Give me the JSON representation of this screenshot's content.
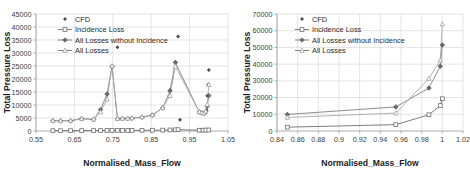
{
  "figure": {
    "panel_count": 2
  },
  "chart_data": [
    {
      "panel_id": "left",
      "type": "scatter",
      "title": "",
      "xlabel": "Normalised_Mass_Flow",
      "ylabel": "Total Pressure Loss",
      "xlim": [
        0.55,
        1.05
      ],
      "ylim": [
        0,
        45000
      ],
      "xticks": [
        0.55,
        0.65,
        0.75,
        0.85,
        0.95,
        1.05
      ],
      "xtick_labels": [
        "0.55",
        "0.65",
        "0.75",
        "0.85",
        "0.95",
        "1.05"
      ],
      "yticks": [
        0,
        5000,
        10000,
        15000,
        20000,
        25000,
        30000,
        35000,
        40000,
        45000
      ],
      "ytick_labels": [
        "0",
        "5000",
        "10000",
        "15000",
        "20000",
        "25000",
        "30000",
        "35000",
        "40000",
        "45000"
      ],
      "grid": "y-major-and-x-major",
      "legend_position": "top-left-inside",
      "legend": [
        "CFD",
        "Incidence Loss",
        "All Losses without Incidence",
        "All Losses"
      ],
      "series": [
        {
          "name": "CFD",
          "marker": "small-diamond",
          "line": false,
          "x": [
            0.594,
            0.614,
            0.64,
            0.669,
            0.7,
            0.718,
            0.735,
            0.748,
            0.762,
            0.775,
            0.789,
            0.8,
            0.826,
            0.853,
            0.88,
            0.899,
            0.913,
            0.92,
            0.925,
            0.975,
            0.98,
            0.985,
            0.988,
            0.99,
            0.992,
            0.994,
            0.996,
            0.998,
            1.0
          ],
          "y": [
            3900,
            3900,
            3900,
            4700,
            4400,
            8200,
            14200,
            24900,
            32200,
            4700,
            4800,
            4900,
            5300,
            6100,
            8900,
            15500,
            26400,
            36300,
            4300,
            7300,
            7100,
            6900,
            6800,
            7000,
            7400,
            8100,
            13600,
            17800,
            23500
          ]
        },
        {
          "name": "Incidence Loss",
          "marker": "open-square",
          "line": true,
          "x": [
            0.594,
            0.614,
            0.64,
            0.669,
            0.7,
            0.718,
            0.735,
            0.748,
            0.762,
            0.775,
            0.789,
            0.8,
            0.826,
            0.853,
            0.88,
            0.899,
            0.913,
            0.92,
            0.975,
            0.985,
            0.992,
            1.0
          ],
          "y": [
            120,
            120,
            130,
            150,
            160,
            180,
            200,
            230,
            260,
            200,
            210,
            230,
            260,
            300,
            340,
            400,
            460,
            520,
            300,
            320,
            350,
            400
          ]
        },
        {
          "name": "All Losses without Incidence",
          "marker": "filled-diamond",
          "line": true,
          "x": [
            0.594,
            0.614,
            0.64,
            0.669,
            0.7,
            0.718,
            0.735,
            0.748,
            0.762,
            0.775,
            0.789,
            0.8,
            0.826,
            0.853,
            0.88,
            0.899,
            0.913,
            0.975,
            0.982,
            0.988,
            0.992,
            0.996,
            1.0
          ],
          "y": [
            3900,
            3900,
            3900,
            4700,
            4400,
            8200,
            14200,
            24900,
            4700,
            4750,
            4800,
            4900,
            5300,
            6100,
            8900,
            15500,
            26400,
            7300,
            6900,
            6800,
            7400,
            9500,
            13600
          ]
        },
        {
          "name": "All Losses",
          "marker": "open-triangle",
          "line": true,
          "x": [
            0.594,
            0.614,
            0.64,
            0.669,
            0.7,
            0.718,
            0.735,
            0.748,
            0.762,
            0.775,
            0.789,
            0.8,
            0.826,
            0.853,
            0.88,
            0.899,
            0.913,
            0.975,
            0.982,
            0.988,
            0.992,
            0.996,
            1.0
          ],
          "y": [
            4000,
            4000,
            4050,
            4800,
            4550,
            7300,
            12200,
            25000,
            4800,
            4850,
            4900,
            5000,
            5400,
            6200,
            9000,
            13600,
            24800,
            7400,
            7000,
            6900,
            7600,
            10200,
            17800
          ]
        }
      ]
    },
    {
      "panel_id": "right",
      "type": "scatter",
      "title": "",
      "xlabel": "Normalised_Mass_Flow",
      "ylabel": "Total Pressure Loss",
      "xlim": [
        0.84,
        1.02
      ],
      "ylim": [
        0,
        70000
      ],
      "xticks": [
        0.84,
        0.86,
        0.88,
        0.9,
        0.92,
        0.94,
        0.96,
        0.98,
        1.0,
        1.02
      ],
      "xtick_labels": [
        "0.84",
        "0.86",
        "0.88",
        "0.9",
        "0.92",
        "0.94",
        "0.96",
        "0.98",
        "1",
        "1.02"
      ],
      "yticks": [
        0,
        10000,
        20000,
        30000,
        40000,
        50000,
        60000,
        70000
      ],
      "ytick_labels": [
        "0",
        "10000",
        "20000",
        "30000",
        "40000",
        "50000",
        "60000",
        "70000"
      ],
      "grid": "y-major-and-x-major",
      "legend_position": "top-left-inside",
      "legend": [
        "CFD",
        "Incidence Loss",
        "All Losses without Incidence",
        "All Losses"
      ],
      "series": [
        {
          "name": "CFD",
          "marker": "small-diamond",
          "line": false,
          "x": [
            0.85,
            0.955,
            0.987,
            0.998,
            1.0
          ],
          "y": [
            9900,
            14400,
            25700,
            38700,
            51500
          ]
        },
        {
          "name": "Incidence Loss",
          "marker": "open-square",
          "line": true,
          "x": [
            0.85,
            0.955,
            0.987,
            0.998,
            1.0
          ],
          "y": [
            2300,
            3800,
            9700,
            15200,
            19300
          ]
        },
        {
          "name": "All Losses without Incidence",
          "marker": "filled-diamond",
          "line": true,
          "x": [
            0.85,
            0.955,
            0.987,
            0.998,
            1.0
          ],
          "y": [
            9900,
            14400,
            25700,
            38700,
            51500
          ]
        },
        {
          "name": "All Losses",
          "marker": "open-triangle",
          "line": true,
          "x": [
            0.85,
            0.955,
            0.987,
            0.998,
            1.0
          ],
          "y": [
            8100,
            10700,
            31400,
            42300,
            64000
          ]
        }
      ]
    }
  ],
  "colors": {
    "grid": "#d9d9d9",
    "axis": "#9a9a9a",
    "text": "#3c3c3c",
    "series_dark": "#6e6e6e",
    "series_light": "#a8a8a8",
    "cfd_marker": "#4d4d4d"
  }
}
